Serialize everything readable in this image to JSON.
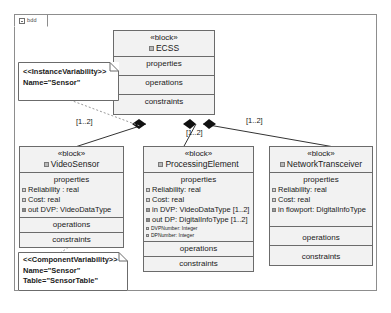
{
  "diagram": {
    "tab_label": "bdd",
    "tab_icon": "diagram-icon",
    "type": "block-definition-diagram"
  },
  "blocks": [
    {
      "id": "ecss",
      "stereotype": "«block»",
      "name": "ECSS",
      "compartments": [
        "properties",
        "operations",
        "constraints"
      ],
      "properties": []
    },
    {
      "id": "video_sensor",
      "stereotype": "«block»",
      "name": "VideoSensor",
      "compartments": [
        "properties",
        "operations",
        "constraints"
      ],
      "properties": [
        {
          "text": "Reliability : real",
          "kind": "value"
        },
        {
          "text": "Cost: real",
          "kind": "value"
        },
        {
          "text": "out DVP: VideoDataType",
          "kind": "out"
        }
      ]
    },
    {
      "id": "processing_element",
      "stereotype": "«block»",
      "name": "ProcessingElement",
      "compartments": [
        "properties",
        "operations",
        "constraints"
      ],
      "properties": [
        {
          "text": "Reliability: real",
          "kind": "value"
        },
        {
          "text": "Cost: real",
          "kind": "value"
        },
        {
          "text": "in DVP: VideoDataType [1..2]",
          "kind": "in"
        },
        {
          "text": "out DP: DigitalInfoType [1..2]",
          "kind": "out"
        },
        {
          "text": "DVPNumber: Integer",
          "kind": "value",
          "small": true
        },
        {
          "text": "DPNumber: Integer",
          "kind": "value",
          "small": true
        }
      ]
    },
    {
      "id": "network_transceiver",
      "stereotype": "«block»",
      "name": "NetworkTransceiver",
      "compartments": [
        "properties",
        "operations",
        "constraints"
      ],
      "properties": [
        {
          "text": "Reliability: real",
          "kind": "value"
        },
        {
          "text": "Cost: real",
          "kind": "value"
        },
        {
          "text": "in flowport: DigitalInfoType",
          "kind": "in"
        }
      ]
    }
  ],
  "notes": [
    {
      "id": "instance_variability",
      "stereotype": "<<InstanceVariability>>",
      "lines": [
        "Name=\"Sensor\""
      ]
    },
    {
      "id": "component_variability",
      "stereotype": "<<ComponentVariability>>",
      "lines": [
        "Name=\"Sensor\"",
        "Table=\"SensorTable\""
      ]
    }
  ],
  "associations": [
    {
      "id": "ecss_videosensor",
      "from": "ECSS",
      "to": "VideoSensor",
      "type": "composition",
      "multiplicity": "[1..2]"
    },
    {
      "id": "ecss_processingelement",
      "from": "ECSS",
      "to": "ProcessingElement",
      "type": "composition",
      "multiplicity": "[1..2]"
    },
    {
      "id": "ecss_networktransceiver",
      "from": "ECSS",
      "to": "NetworkTransceiver",
      "type": "composition",
      "multiplicity": "[1..2]"
    }
  ],
  "colors": {
    "block_fill": "#f2f2f2",
    "block_border": "#6b6b6b",
    "note_fill": "#ffffff",
    "frame_border": "#8d8d8d",
    "line": "#333333",
    "canvas": "#ffffff"
  }
}
